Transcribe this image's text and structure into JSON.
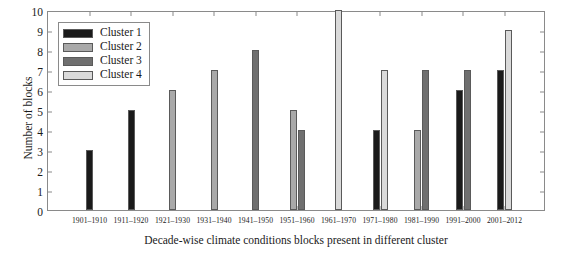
{
  "chart_data": {
    "type": "bar",
    "title": "",
    "xlabel": "Decade-wise climate conditions blocks present in different cluster",
    "ylabel": "Number of blocks",
    "ylim": [
      0,
      10
    ],
    "ytick_labels": [
      "0",
      "1",
      "2",
      "3",
      "4",
      "5",
      "6",
      "7",
      "8",
      "9",
      "10"
    ],
    "yticks": [
      0,
      1,
      2,
      3,
      4,
      5,
      6,
      7,
      8,
      9,
      10
    ],
    "grid": false,
    "legend_position": "upper-left-inside",
    "categories": [
      "1901–1910",
      "1911–1920",
      "1921–1930",
      "1931–1940",
      "1941–1950",
      "1951–1960",
      "1961–1970",
      "1971–1980",
      "1981–1990",
      "1991–2000",
      "2001–2012"
    ],
    "series": [
      {
        "name": "Cluster 1",
        "color": "#1a1a1a",
        "values": [
          3,
          5,
          null,
          null,
          null,
          null,
          null,
          4,
          null,
          6,
          7
        ]
      },
      {
        "name": "Cluster 2",
        "color": "#a9a9a9",
        "values": [
          null,
          null,
          6,
          7,
          null,
          5,
          null,
          null,
          4,
          null,
          null
        ]
      },
      {
        "name": "Cluster 3",
        "color": "#6f6f6f",
        "values": [
          null,
          null,
          null,
          null,
          8,
          4,
          null,
          null,
          7,
          7,
          null
        ]
      },
      {
        "name": "Cluster 4",
        "color": "#dadada",
        "values": [
          null,
          null,
          null,
          null,
          null,
          null,
          10,
          7,
          null,
          null,
          9
        ]
      }
    ]
  },
  "legend": {
    "entries": [
      {
        "label": "Cluster 1",
        "color": "#1a1a1a"
      },
      {
        "label": "Cluster 2",
        "color": "#a9a9a9"
      },
      {
        "label": "Cluster 3",
        "color": "#6f6f6f"
      },
      {
        "label": "Cluster 4",
        "color": "#dadada"
      }
    ]
  }
}
